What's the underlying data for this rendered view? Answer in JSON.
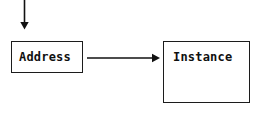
{
  "diagram": {
    "background_color": "#ffffff",
    "stroke_color": "#111111",
    "text_color": "#101010",
    "nodes": [
      {
        "id": "address",
        "label": "Address",
        "shape": "rectangle",
        "x": 11,
        "y": 41,
        "width": 72,
        "height": 32
      },
      {
        "id": "instance",
        "label": "Instance",
        "shape": "rectangle",
        "x": 163,
        "y": 41,
        "width": 87,
        "height": 62
      }
    ],
    "arrows": [
      {
        "id": "incoming-arrow",
        "label": "",
        "direction": "down",
        "from": "top-edge",
        "to": "address",
        "x1": 24,
        "y1": 0,
        "x2": 24,
        "y2": 29
      },
      {
        "id": "address-to-instance-arrow",
        "label": "",
        "direction": "right",
        "from": "address",
        "to": "instance",
        "x1": 88,
        "y1": 58,
        "x2": 160,
        "y2": 58
      }
    ]
  }
}
